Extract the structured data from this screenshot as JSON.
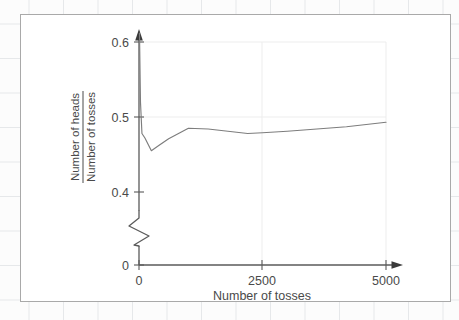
{
  "figure": {
    "background_color": "#ffffff",
    "frame_color": "#a9a9a9",
    "paper_grid_color": "#e6e8ea"
  },
  "chart_data": {
    "type": "line",
    "title": "",
    "subtitle": "",
    "xlabel": "Number of tosses",
    "ylabel_numerator": "Number of heads",
    "ylabel_denominator": "Number of tosses",
    "ylabel": "Number of heads / Number of tosses",
    "xlim": [
      0,
      5000
    ],
    "ylim": [
      0.4,
      0.6
    ],
    "y_axis_break": true,
    "y_axis_break_note": "zigzag break between 0 and 0.4",
    "xticks": [
      0,
      2500,
      5000
    ],
    "xticklabels": [
      "0",
      "2500",
      "5000"
    ],
    "yticks": [
      0,
      0.4,
      0.5,
      0.6
    ],
    "yticklabels": [
      "0",
      "0.4",
      "0.5",
      "0.6"
    ],
    "grid": true,
    "grid_color": "#ebebeb",
    "legend": "none",
    "line_color": "#7d7d7d",
    "x": [
      10,
      30,
      60,
      120,
      250,
      400,
      600,
      1000,
      1400,
      1800,
      2200,
      2500,
      3000,
      3600,
      4200,
      5000
    ],
    "y": [
      0.612,
      0.52,
      0.478,
      0.472,
      0.455,
      0.462,
      0.471,
      0.485,
      0.484,
      0.481,
      0.478,
      0.479,
      0.481,
      0.484,
      0.487,
      0.493
    ],
    "series": [
      {
        "name": "Proportion of heads",
        "values": [
          0.612,
          0.52,
          0.478,
          0.472,
          0.455,
          0.462,
          0.471,
          0.485,
          0.484,
          0.481,
          0.478,
          0.479,
          0.481,
          0.484,
          0.487,
          0.493
        ]
      }
    ]
  }
}
